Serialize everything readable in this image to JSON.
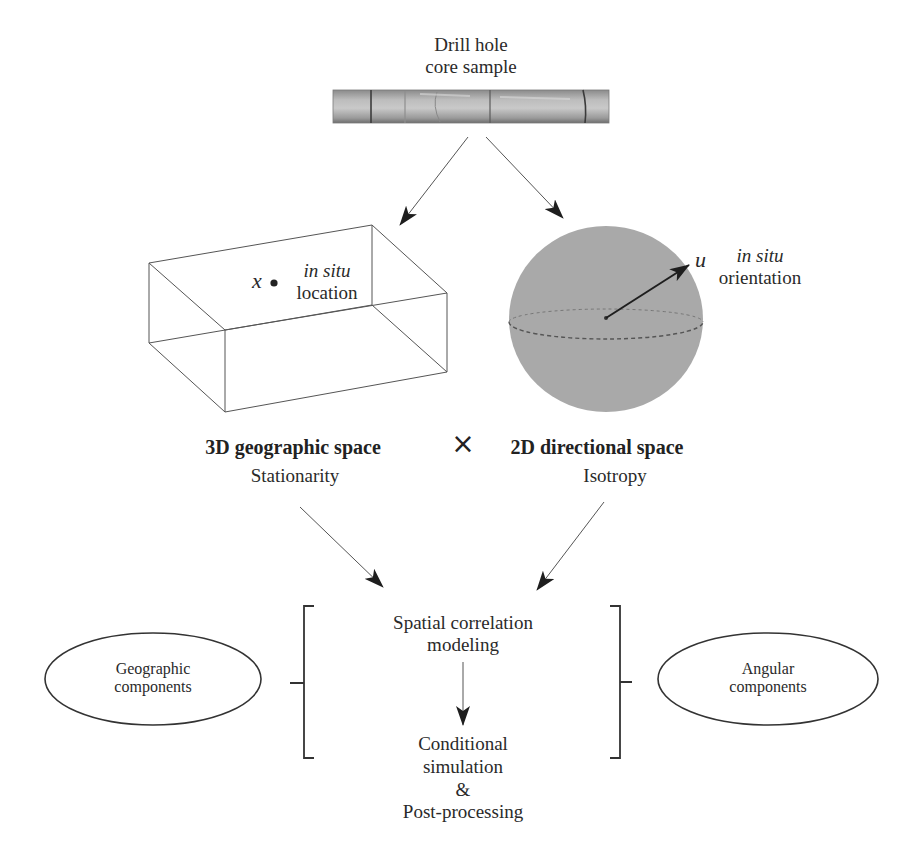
{
  "figure": {
    "core_sample": {
      "title_line1": "Drill hole",
      "title_line2": "core sample"
    },
    "geographic": {
      "variable": "x",
      "note_italic": "in situ",
      "note_plain": "location",
      "space_label": "3D geographic space",
      "assumption": "Stationarity"
    },
    "directional": {
      "variable": "u",
      "note_italic": "in situ",
      "note_plain": "orientation",
      "space_label": "2D directional space",
      "assumption": "Isotropy"
    },
    "product_symbol": "×",
    "workflow": {
      "step1_line1": "Spatial correlation",
      "step1_line2": "modeling",
      "step2_line1": "Conditional",
      "step2_line2": "simulation",
      "step2_line3": "&",
      "step2_line4": "Post-processing"
    },
    "components": {
      "left_line1": "Geographic",
      "left_line2": "components",
      "right_line1": "Angular",
      "right_line2": "components"
    },
    "colors": {
      "line": "#555555",
      "arrowhead": "#1e1e1e",
      "sphere_fill": "#a9a9a9",
      "core_dark": "#6b6b6b",
      "core_light": "#c4c4c4"
    }
  }
}
